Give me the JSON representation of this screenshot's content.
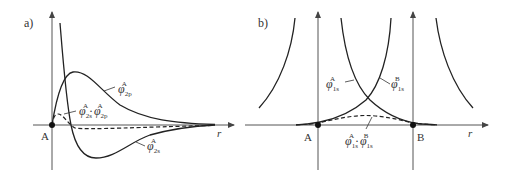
{
  "panel_a": {
    "label": "a)",
    "origin_label": "A",
    "axis_label": "r",
    "curves": [
      {
        "name": "phi_2p_A",
        "symbol": "φ",
        "sub": "2p",
        "sup": "A",
        "style": "solid"
      },
      {
        "name": "phi_2s_A",
        "symbol": "φ",
        "sub": "2s",
        "sup": "A",
        "style": "solid"
      },
      {
        "name": "phi_2s_A_times_phi_2p_A",
        "symbol": "φ",
        "sub": "2s",
        "sup": "A",
        "dot": "·",
        "symbol2": "φ",
        "sub2": "2p",
        "sup2": "A",
        "style": "dashed"
      }
    ]
  },
  "panel_b": {
    "label": "b)",
    "point_a_label": "A",
    "point_b_label": "B",
    "axis_label": "r",
    "curves": [
      {
        "name": "phi_1s_A",
        "symbol": "φ",
        "sub": "1s",
        "sup": "A",
        "style": "solid"
      },
      {
        "name": "phi_1s_B",
        "symbol": "φ",
        "sub": "1s",
        "sup": "B",
        "style": "solid"
      },
      {
        "name": "phi_1s_A_times_phi_1s_B",
        "symbol": "φ",
        "sub": "1s",
        "sup": "A",
        "dot": "·",
        "symbol2": "φ",
        "sub2": "1s",
        "sup2": "B",
        "style": "dashed"
      }
    ]
  }
}
